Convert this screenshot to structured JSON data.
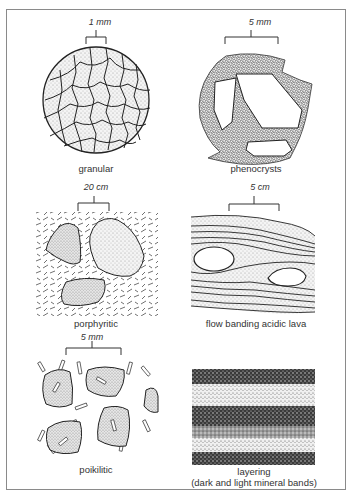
{
  "figure": {
    "panels": [
      {
        "id": "granular",
        "scale": "1 mm",
        "label": "granular"
      },
      {
        "id": "phenocrysts",
        "scale": "5 mm",
        "label": "phenocrysts"
      },
      {
        "id": "porphyritic",
        "scale": "20 cm",
        "label": "porphyritic"
      },
      {
        "id": "flow-banding",
        "scale": "5 cm",
        "label": "flow banding acidic lava"
      },
      {
        "id": "poikilitic",
        "scale": "5 mm",
        "label": "poikilitic"
      },
      {
        "id": "layering",
        "scale": "",
        "label": "layering",
        "sublabel": "(dark and light mineral bands)"
      }
    ]
  },
  "colors": {
    "frame": "#8a8a8a",
    "ink": "#2a2a2a",
    "stipple": "#bdbdbd"
  }
}
